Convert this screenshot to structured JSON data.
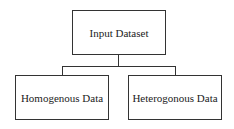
{
  "diagram": {
    "type": "tree",
    "root": {
      "label": "Input Dataset"
    },
    "children": [
      {
        "label": "Homogenous Data"
      },
      {
        "label": "Heterogonous Data"
      }
    ]
  }
}
